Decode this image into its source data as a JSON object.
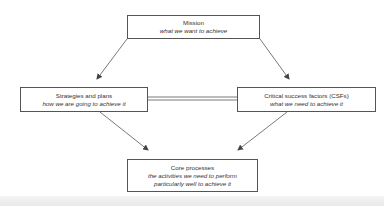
{
  "diagram": {
    "type": "flow",
    "nodes": [
      {
        "id": "mission",
        "title": "Mission",
        "subtitle_lines": [
          "what we want to achieve"
        ]
      },
      {
        "id": "strategies",
        "title": "Strategies and plans",
        "subtitle_lines": [
          "how we are going to achieve it"
        ]
      },
      {
        "id": "csfs",
        "title": "Critical success factors (CSFs)",
        "subtitle_lines": [
          "what we need to achieve it"
        ]
      },
      {
        "id": "core",
        "title": "Core processes",
        "subtitle_lines": [
          "the activities we need to perform",
          "particularly well to achieve it"
        ]
      }
    ],
    "edges": [
      {
        "from": "mission",
        "to": "strategies",
        "style": "arrow"
      },
      {
        "from": "mission",
        "to": "csfs",
        "style": "arrow"
      },
      {
        "from": "strategies",
        "to": "csfs",
        "style": "double-line"
      },
      {
        "from": "strategies",
        "to": "core",
        "style": "arrow"
      },
      {
        "from": "csfs",
        "to": "core",
        "style": "arrow"
      }
    ]
  },
  "colors": {
    "line": "#555555",
    "box_border": "#555555",
    "text": "#333333",
    "background": "#ffffff"
  }
}
